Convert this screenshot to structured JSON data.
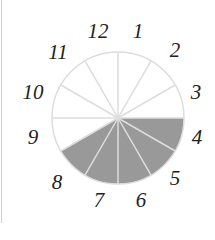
{
  "diagram": {
    "type": "clock-fraction",
    "total_sectors": 12,
    "shaded_sectors": 5,
    "shaded_from_hour": 3,
    "shaded_to_hour": 8,
    "colors": {
      "shade": "#999999",
      "spoke": "#dddddd",
      "outline": "#dddddd",
      "numeral": "#222222"
    },
    "numerals": [
      {
        "label": "12",
        "x": 98,
        "y": 31
      },
      {
        "label": "1",
        "x": 138,
        "y": 31
      },
      {
        "label": "2",
        "x": 175,
        "y": 50
      },
      {
        "label": "3",
        "x": 196,
        "y": 92
      },
      {
        "label": "4",
        "x": 197,
        "y": 137
      },
      {
        "label": "5",
        "x": 175,
        "y": 178
      },
      {
        "label": "6",
        "x": 141,
        "y": 200
      },
      {
        "label": "7",
        "x": 99,
        "y": 200
      },
      {
        "label": "8",
        "x": 57,
        "y": 182
      },
      {
        "label": "9",
        "x": 33,
        "y": 137
      },
      {
        "label": "10",
        "x": 33,
        "y": 92
      },
      {
        "label": "11",
        "x": 58,
        "y": 52
      }
    ]
  }
}
